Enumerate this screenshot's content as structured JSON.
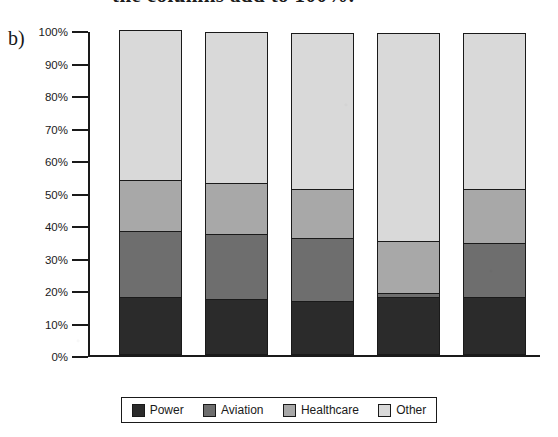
{
  "figure": {
    "label": "b)",
    "cropped_caption_above": "the columns add to 100%."
  },
  "legend": {
    "position": "bottom-center",
    "items": [
      {
        "label": "Power",
        "color": "#2b2b2b"
      },
      {
        "label": "Aviation",
        "color": "#6e6e6e"
      },
      {
        "label": "Healthcare",
        "color": "#a8a8a8"
      },
      {
        "label": "Other",
        "color": "#d9d9d9"
      }
    ]
  },
  "chart_data": {
    "type": "bar",
    "subtype": "stacked-100-percent",
    "title": "",
    "xlabel": "",
    "ylabel": "",
    "categories": [
      "2015",
      "2014",
      "2013",
      "2012",
      "2011"
    ],
    "ylim": [
      0,
      100
    ],
    "ytick_labels": [
      "100%",
      "90%",
      "80%",
      "70%",
      "60%",
      "50%",
      "40%",
      "30%",
      "20%",
      "10%",
      "0%"
    ],
    "ytick_values": [
      100,
      90,
      80,
      70,
      60,
      50,
      40,
      30,
      20,
      10,
      0
    ],
    "grid": false,
    "series": [
      {
        "name": "Power",
        "color": "#2b2b2b",
        "values": [
          17.5,
          17.0,
          16.5,
          17.5,
          17.5
        ]
      },
      {
        "name": "Aviation",
        "color": "#6e6e6e",
        "values": [
          20.5,
          20.0,
          19.5,
          1.5,
          17.0
        ]
      },
      {
        "name": "Healthcare",
        "color": "#a8a8a8",
        "values": [
          16.0,
          16.0,
          15.0,
          16.0,
          16.5
        ]
      },
      {
        "name": "Other",
        "color": "#d9d9d9",
        "values": [
          46.0,
          46.5,
          48.0,
          64.0,
          48.0
        ]
      }
    ],
    "cumulative_tops": {
      "2015": {
        "power": 17.5,
        "aviation": 38.0,
        "healthcare": 54.0,
        "other": 100.0
      },
      "2014": {
        "power": 17.0,
        "aviation": 37.0,
        "healthcare": 53.0,
        "other": 99.5
      },
      "2013": {
        "power": 16.5,
        "aviation": 36.0,
        "healthcare": 51.0,
        "other": 99.5
      },
      "2012": {
        "power": 17.5,
        "aviation": 19.0,
        "healthcare": 35.0,
        "other": 99.0
      },
      "2011": {
        "power": 17.5,
        "aviation": 34.5,
        "healthcare": 51.0,
        "other": 99.0
      }
    }
  }
}
